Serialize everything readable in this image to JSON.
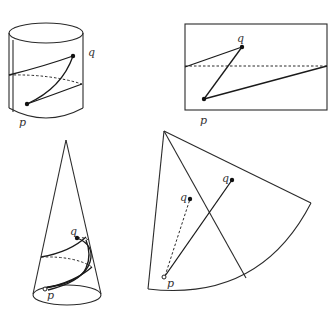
{
  "figure": {
    "panels": [
      {
        "name": "cylinder",
        "labels": {
          "p": "p",
          "q": "q"
        }
      },
      {
        "name": "unrolled-cylinder",
        "labels": {
          "p": "p",
          "q": "q"
        }
      },
      {
        "name": "cone",
        "labels": {
          "p": "p",
          "q": "q"
        }
      },
      {
        "name": "unrolled-cone",
        "labels": {
          "p": "p",
          "q1": "q",
          "q2": "q"
        }
      }
    ]
  }
}
